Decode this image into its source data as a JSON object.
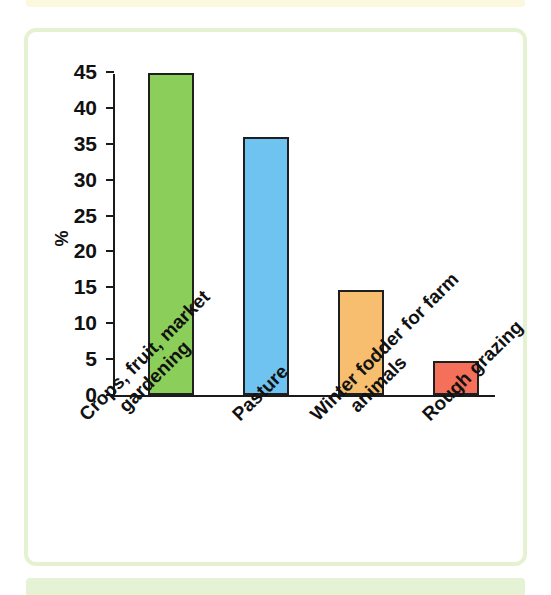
{
  "figure": {
    "frame_color": "#e4f2d2",
    "top_strip_color": "#fcf8df",
    "bottom_strip_color": "#e5f3d4",
    "background": "#ffffff"
  },
  "chart_data": {
    "type": "bar",
    "title": "",
    "subtitle": "",
    "xlabel": "",
    "ylabel": "%",
    "ylim": [
      0,
      45
    ],
    "ytick_step": 5,
    "grid": false,
    "legend": false,
    "categories": [
      "Crops, fruit, market gardening",
      "Pasture",
      "Winter fodder for farm animals",
      "Rough grazing"
    ],
    "category_lines": [
      [
        "Crops, fruit, market",
        "gardening"
      ],
      [
        "Pasture"
      ],
      [
        "Winter fodder for farm",
        "animals"
      ],
      [
        "Rough grazing"
      ]
    ],
    "values": [
      44.8,
      36.0,
      14.6,
      4.7
    ],
    "colors": [
      "#8cce5a",
      "#6fc3f0",
      "#f6be6e",
      "#f4705a"
    ],
    "bar_edge_color": "#1f1f1f",
    "ytick_labels": [
      "0",
      "5",
      "10",
      "15",
      "20",
      "25",
      "30",
      "35",
      "40",
      "45"
    ],
    "ytick_values": [
      0,
      5,
      10,
      15,
      20,
      25,
      30,
      35,
      40,
      45
    ],
    "axis_color": "#1a1a1a"
  }
}
